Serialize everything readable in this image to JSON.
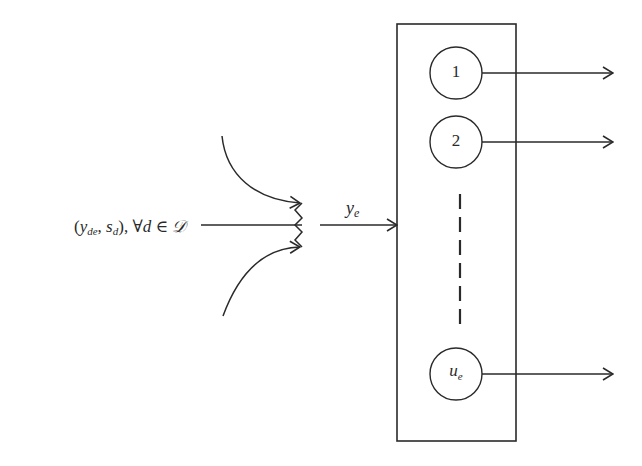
{
  "diagram": {
    "input": {
      "label_open": "(",
      "y_var": "y",
      "y_sub": "de",
      "sep": ", ",
      "s_var": "s",
      "s_sub": "d",
      "close": "), ",
      "forall": "∀",
      "d_var": "d",
      "elem": " ∈ ",
      "set": "𝒟"
    },
    "merged_flow": {
      "var": "y",
      "sub": "e"
    },
    "node": {
      "units": [
        {
          "label": "1",
          "sub": ""
        },
        {
          "label": "2",
          "sub": ""
        },
        {
          "label": "u",
          "sub": "e"
        }
      ],
      "ellipsis": "dashed-vertical-line"
    },
    "colors": {
      "stroke": "#2a2a2a",
      "background": "#ffffff"
    }
  }
}
